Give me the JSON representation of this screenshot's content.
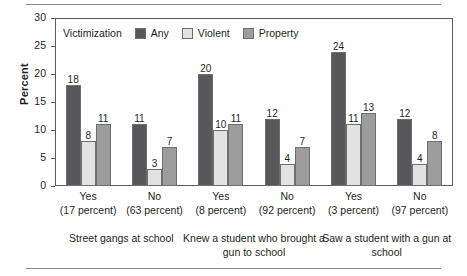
{
  "chart_data": {
    "type": "bar",
    "title": "",
    "xlabel": "",
    "ylabel": "Percent",
    "ylim": [
      0,
      30
    ],
    "yticks": [
      0,
      5,
      10,
      15,
      20,
      25,
      30
    ],
    "ytick_labels": [
      "0",
      "5",
      "10",
      "15",
      "20",
      "25",
      "30"
    ],
    "grid": false,
    "legend_position": "inside top-left",
    "legend_title": "Victimization",
    "series": [
      {
        "name": "Any",
        "color": "#58585a",
        "values": [
          18,
          11,
          20,
          12,
          24,
          12
        ]
      },
      {
        "name": "Violent",
        "color": "#e2e2e2",
        "values": [
          8,
          3,
          10,
          4,
          11,
          4
        ]
      },
      {
        "name": "Property",
        "color": "#9d9d9d",
        "values": [
          11,
          7,
          11,
          7,
          13,
          8
        ]
      }
    ],
    "categories": [
      "Yes (17 percent)",
      "No (63 percent)",
      "Yes (8 percent)",
      "No (92 percent)",
      "Yes (3 percent)",
      "No (97 percent)"
    ],
    "tick_groups": [
      {
        "name": "Yes",
        "percent": "(17 percent)"
      },
      {
        "name": "No",
        "percent": "(63 percent)"
      },
      {
        "name": "Yes",
        "percent": "(8 percent)"
      },
      {
        "name": "No",
        "percent": "(92 percent)"
      },
      {
        "name": "Yes",
        "percent": "(3 percent)"
      },
      {
        "name": "No",
        "percent": "(97 percent)"
      }
    ],
    "group_labels": [
      "Street gangs at school",
      "Knew a student who brought a gun to school",
      "Saw a student with a gun at school"
    ]
  }
}
